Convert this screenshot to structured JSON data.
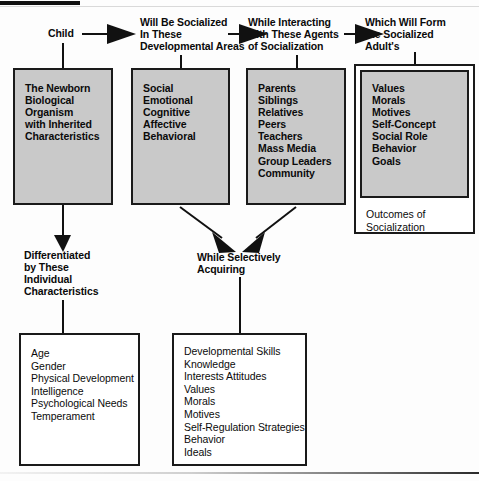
{
  "diagram": {
    "title_bar_present": true,
    "flow_captions": [
      {
        "id": "child",
        "text": "Child"
      },
      {
        "id": "developmental-areas",
        "text": "Will Be Socialized\nIn These\nDevelopmental Areas"
      },
      {
        "id": "agents",
        "text": "While Interacting\nwith These Agents\nof Socialization"
      },
      {
        "id": "socialized-adult",
        "text": "Which Will Form\nthe Socialized\nAdult's"
      }
    ],
    "sub_captions": [
      {
        "id": "differentiated",
        "text": "Differentiated\nby These\nIndividual\nCharacteristics"
      },
      {
        "id": "acquiring",
        "text": "While Selectively\nAcquiring"
      }
    ],
    "boxes": [
      {
        "id": "newborn-box",
        "style": "gray",
        "items": "The Newborn\nBiological\nOrganism\n with Inherited\nCharacteristics"
      },
      {
        "id": "developmental-areas-box",
        "style": "gray",
        "items": "Social\nEmotional\nCognitive\nAffective\nBehavioral"
      },
      {
        "id": "agents-box",
        "style": "gray",
        "items": "Parents\nSiblings\nRelatives\nPeers\nTeachers\nMass Media\nGroup Leaders\nCommunity"
      },
      {
        "id": "outcomes-box",
        "style": "nested",
        "items": "Values\nMorals\nMotives\nSelf-Concept\nSocial Role\nBehavior\nGoals",
        "caption": "Outcomes of\nSocialization"
      },
      {
        "id": "individual-characteristics-box",
        "style": "white",
        "items": "Age\nGender\nPhysical Development\nIntelligence\nPsychological Needs\nTemperament"
      },
      {
        "id": "acquired-box",
        "style": "white",
        "items": "Developmental Skills\nKnowledge\nInterests Attitudes\nValues\nMorals\nMotives\nSelf-Regulation Strategies\nBehavior\nIdeals"
      }
    ],
    "colors": {
      "box_fill_gray": "#c9c9c9",
      "box_fill_white": "#ffffff",
      "ink": "#111111",
      "page": "#fdfdfd"
    }
  }
}
